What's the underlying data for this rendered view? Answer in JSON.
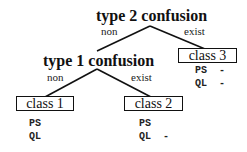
{
  "tree": {
    "root": {
      "label": "type 2 confusion",
      "left_edge": "non",
      "right_edge": "exist"
    },
    "inner": {
      "label": "type 1 confusion",
      "left_edge": "non",
      "right_edge": "exist"
    },
    "leaves": [
      {
        "label": "class 1",
        "attrs": [
          {
            "name": "PS",
            "mark": ""
          },
          {
            "name": "QL",
            "mark": ""
          }
        ]
      },
      {
        "label": "class 2",
        "attrs": [
          {
            "name": "PS",
            "mark": ""
          },
          {
            "name": "QL",
            "mark": "-"
          }
        ]
      },
      {
        "label": "class 3",
        "attrs": [
          {
            "name": "PS",
            "mark": "-"
          },
          {
            "name": "QL",
            "mark": "-"
          }
        ]
      }
    ]
  },
  "colors": {
    "line": "#111111",
    "text": "#111111"
  }
}
